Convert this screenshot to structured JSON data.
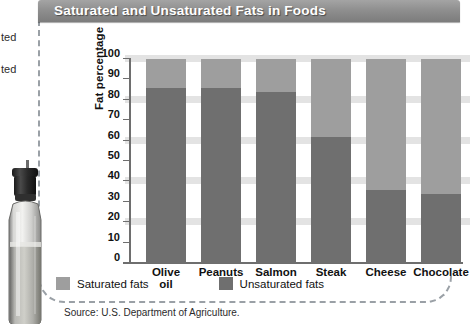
{
  "title": "Saturated and Unsaturated Fats in Foods",
  "edge_fragments": [
    "ted",
    "ted"
  ],
  "source": "Source: U.S. Department of Agriculture.",
  "legend": [
    {
      "label": "Saturated fats",
      "color": "#9e9e9e",
      "key": "saturated"
    },
    {
      "label": "Unsaturated fats",
      "color": "#6f6f6f",
      "key": "unsaturated"
    }
  ],
  "colors": {
    "title_bar": "#8f8f8f",
    "title_text": "#ffffff",
    "saturated": "#9e9e9e",
    "unsaturated": "#6f6f6f",
    "band": "#e3e3e3",
    "axis": "#6e6e6e",
    "dashed_border": "#9aa0a6"
  },
  "chart_data": {
    "type": "bar",
    "stacked": true,
    "title": "Saturated and Unsaturated Fats in Foods",
    "xlabel": "",
    "ylabel": "Fat percentage",
    "ylim": [
      0,
      100
    ],
    "yticks": [
      0,
      10,
      20,
      30,
      40,
      50,
      60,
      70,
      80,
      90,
      100
    ],
    "ytick_labels": [
      "0",
      "10",
      "20",
      "30",
      "40",
      "50",
      "60",
      "70",
      "80",
      "90",
      "100"
    ],
    "grid": "horizontal-bands-every-20",
    "legend_position": "bottom-left",
    "categories": [
      "Olive oil",
      "Peanuts",
      "Salmon",
      "Steak",
      "Cheese",
      "Chocolate"
    ],
    "category_lines": [
      [
        "Olive",
        "oil"
      ],
      [
        "Peanuts"
      ],
      [
        "Salmon"
      ],
      [
        "Steak"
      ],
      [
        "Cheese"
      ],
      [
        "Chocolate"
      ]
    ],
    "series": [
      {
        "name": "Unsaturated fats",
        "color": "#6f6f6f",
        "values": [
          86,
          86,
          84,
          62,
          36,
          34
        ]
      },
      {
        "name": "Saturated fats",
        "color": "#9e9e9e",
        "values": [
          14,
          14,
          16,
          38,
          64,
          66
        ]
      }
    ]
  }
}
